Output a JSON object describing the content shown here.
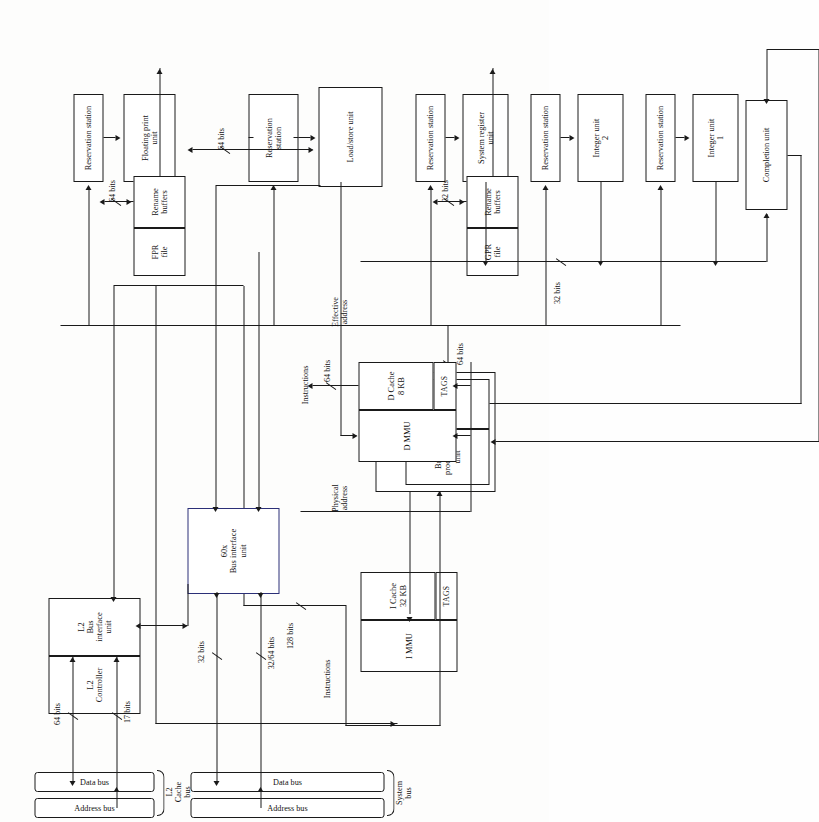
{
  "figure": {
    "orientation": "rotated-90-ccw"
  },
  "blocks": {
    "instruction_unit": "Instruction unit",
    "branch_processing_unit": "Branch\nprocessing\nunit",
    "dispatch_unit": "Dispatch\nunit",
    "i_mmu": "I MMU",
    "i_cache": "I Cache\n32 KB",
    "i_cache_tags": "TAGS",
    "d_mmu": "D MMU",
    "d_cache": "D Cache\n8 KB",
    "d_cache_tags": "TAGS",
    "reservation_station_fp": "Reservation station",
    "reservation_station_ls": "Reservation\nstation",
    "reservation_station_sr": "Reservation station",
    "reservation_station_iu2": "Reservation station",
    "reservation_station_iu1": "Reservation station",
    "floating_point_unit": "Floating print\nunit",
    "load_store_unit": "Load/store unit",
    "system_register_unit": "System register\nunit",
    "integer_unit_2": "Integer unit\n2",
    "integer_unit_1": "Integer unit\n1",
    "fpr_file": "FPR\nfile",
    "fpr_rename_buffers": "Rename\nbuffers",
    "gpr_file": "GPR\nfile",
    "gpr_rename_buffers": "Rename\nbuffers",
    "completion_unit": "Completion unit",
    "l2_controller": "L2\nController",
    "l2_bus_interface_unit": "L2\nBus\ninterface\nunit",
    "bus_interface_unit_60x": "60x\nBus interface\nunit"
  },
  "labels": {
    "instructions_top": "Instructions",
    "instructions_mid": "Instructions",
    "bits_128": "128 bits",
    "bits_64_dispatch": "64 bits",
    "bits_64_fpr": "64 bits",
    "bits_64_lsu": "64 bits",
    "bits_32_gpr": "32 bits",
    "bits_32_completion": "32 bits",
    "bits_64_dcache": "64 bits",
    "bits_64_l2": "64 bits",
    "bits_17_l2": "17 bits",
    "bits_32_sys": "32 bits",
    "bits_32_64_sys": "32/64 bits",
    "physical_address": "Physical\naddress",
    "effective_address": "Effective\naddress"
  },
  "buses": {
    "l2_cache_bus": "L2\nCache\nbus",
    "l2_data_bus": "Data bus",
    "l2_address_bus": "Address bus",
    "system_bus": "System\nbus",
    "sys_data_bus": "Data bus",
    "sys_address_bus": "Address bus"
  },
  "colors": {
    "ink": "#1a1a1a",
    "paper": "#fdfdfc",
    "accent_controller": "#2f7d4f",
    "accent_unit_border": "#2b2f77"
  }
}
